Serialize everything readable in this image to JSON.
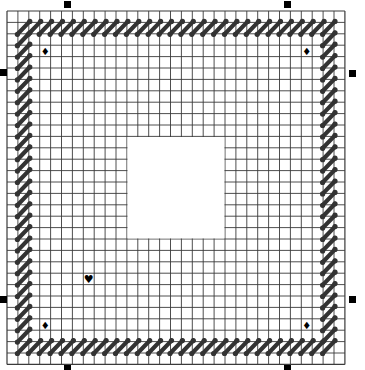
{
  "pattern": {
    "grid": {
      "origin_x": 7,
      "origin_y": 11,
      "cols": 31,
      "rows": 31,
      "cell_w": 10.9,
      "cell_h": 11.4,
      "line_color": "#3a3a3a",
      "background": "#ffffff"
    },
    "blank_area": {
      "col": 11,
      "row": 11,
      "cols": 9,
      "rows": 9,
      "color": "#ffffff"
    },
    "border_stitches": {
      "color": "#333333",
      "top_row": 1,
      "bottom_row": 29,
      "left_col": 1,
      "right_col": 29,
      "from": 1,
      "to": 29
    },
    "symbols": [
      {
        "name": "diamond",
        "glyph": "♦",
        "col": 3,
        "row": 3
      },
      {
        "name": "diamond",
        "glyph": "♦",
        "col": 27,
        "row": 3
      },
      {
        "name": "diamond",
        "glyph": "♦",
        "col": 3,
        "row": 27
      },
      {
        "name": "diamond",
        "glyph": "♦",
        "col": 27,
        "row": 27
      },
      {
        "name": "heart",
        "glyph": "♥",
        "col": 7,
        "row": 23
      }
    ]
  },
  "selection_handles": [
    {
      "position": "top-left",
      "x": 64,
      "y": 1
    },
    {
      "position": "top-right",
      "x": 284,
      "y": 1
    },
    {
      "position": "left-top",
      "x": 0,
      "y": 69
    },
    {
      "position": "left-bottom",
      "x": 0,
      "y": 296
    },
    {
      "position": "right-top",
      "x": 349,
      "y": 70
    },
    {
      "position": "right-bottom",
      "x": 349,
      "y": 296
    },
    {
      "position": "bottom-left",
      "x": 64,
      "y": 365
    },
    {
      "position": "bottom-right",
      "x": 284,
      "y": 365
    }
  ]
}
